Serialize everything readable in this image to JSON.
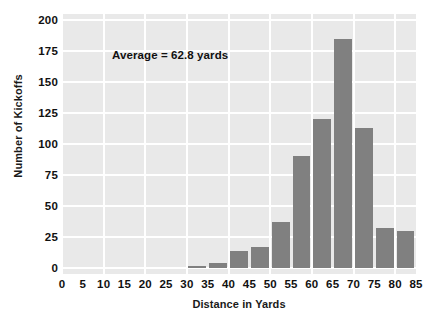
{
  "chart_data": {
    "type": "bar",
    "title": "",
    "subtitle": "",
    "xlabel": "Distance in Yards",
    "ylabel": "Number of Kickoffs",
    "xlim": [
      0,
      85
    ],
    "ylim": [
      0,
      200
    ],
    "xticks": [
      0,
      5,
      10,
      15,
      20,
      25,
      30,
      35,
      40,
      45,
      50,
      55,
      60,
      65,
      70,
      75,
      80,
      85
    ],
    "yticks": [
      0,
      25,
      50,
      75,
      100,
      125,
      150,
      175,
      200
    ],
    "grid": true,
    "legend": false,
    "bin_width": 5,
    "bin_starts": [
      30,
      35,
      40,
      45,
      50,
      55,
      60,
      65,
      70,
      75,
      80
    ],
    "categories": [
      "30-35",
      "35-40",
      "40-45",
      "45-50",
      "50-55",
      "55-60",
      "60-65",
      "65-70",
      "70-75",
      "75-80",
      "80-85"
    ],
    "values": [
      2,
      4,
      14,
      17,
      37,
      90,
      120,
      185,
      113,
      32,
      30
    ],
    "annotations": [
      {
        "text": "Average = 62.8 yards",
        "x": 12,
        "y": 167
      }
    ],
    "colors": {
      "bar": "#808080",
      "plot_background": "#e9e9e9",
      "gridline": "#ffffff",
      "text": "#111111",
      "figure_background": "#ffffff"
    }
  }
}
